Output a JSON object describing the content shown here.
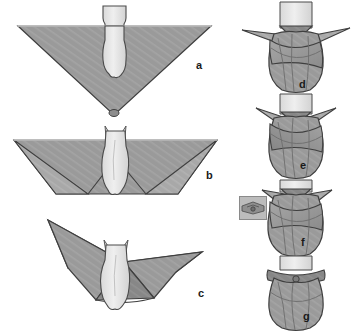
{
  "figure": {
    "panel_count": 7,
    "background_color": "#ffffff",
    "cloth_color": "#9a9a9a",
    "cloth_shade_dark": "#7f7f7f",
    "cloth_shade_light": "#ababab",
    "body_color": "#e6e6e6",
    "outline_color": "#3b3b3b",
    "label_color": "#1a1a1a"
  },
  "panels": [
    {
      "id": "a",
      "label": "a",
      "column": "left",
      "step": 1,
      "description": "Infant laid on a large cloth folded into a downward-pointing triangle, head above the top edge",
      "icon_name": "triangle-cloth-flat-icon"
    },
    {
      "id": "b",
      "label": "b",
      "column": "left",
      "step": 2,
      "description": "Bottom point of the triangle folded up over the infant's feet, forming a trapezoid",
      "icon_name": "bottom-flap-folded-icon"
    },
    {
      "id": "c",
      "label": "c",
      "column": "left",
      "step": 3,
      "description": "Left and right side wings of the cloth lifted outward, ready to wrap across the body",
      "icon_name": "side-wings-raised-icon"
    },
    {
      "id": "d",
      "label": "d",
      "column": "right",
      "step": 4,
      "description": "First side wing pulled across the chest and tucked behind the body",
      "icon_name": "first-wrap-icon"
    },
    {
      "id": "e",
      "label": "e",
      "column": "right",
      "step": 5,
      "description": "Second side wing drawn across in the opposite direction, wrapping the torso",
      "icon_name": "second-wrap-icon"
    },
    {
      "id": "f",
      "label": "f",
      "column": "right",
      "step": 6,
      "description": "Upper corners folded down and secured at the chest; inset detail shows the closure",
      "icon_name": "secure-closure-icon",
      "has_inset": true,
      "inset_description": "Close-up detail of the fastening at the neckline"
    },
    {
      "id": "g",
      "label": "g",
      "column": "right",
      "step": 7,
      "description": "Completed swaddle with the wrap fastened and the head free",
      "icon_name": "completed-swaddle-icon"
    }
  ]
}
